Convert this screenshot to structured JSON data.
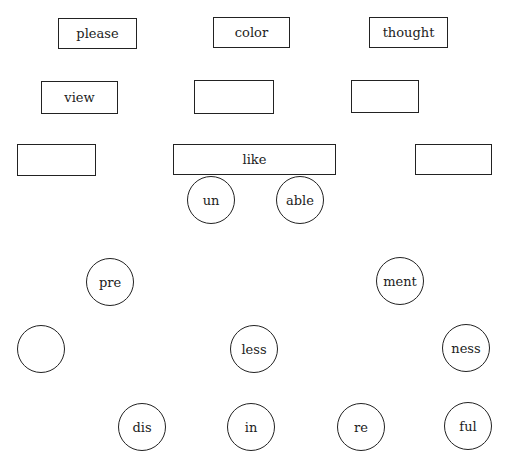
{
  "diagram": {
    "title": "",
    "root_boxes": [
      {
        "label": "please"
      },
      {
        "label": "color"
      },
      {
        "label": "thought"
      },
      {
        "label": "view"
      },
      {
        "label": ""
      },
      {
        "label": ""
      },
      {
        "label": ""
      },
      {
        "label": "like"
      },
      {
        "label": ""
      }
    ],
    "affix_circles": [
      {
        "label": "un"
      },
      {
        "label": "able"
      },
      {
        "label": "pre"
      },
      {
        "label": "ment"
      },
      {
        "label": ""
      },
      {
        "label": "less"
      },
      {
        "label": "ness"
      },
      {
        "label": "dis"
      },
      {
        "label": "in"
      },
      {
        "label": "re"
      },
      {
        "label": "ful"
      }
    ]
  }
}
